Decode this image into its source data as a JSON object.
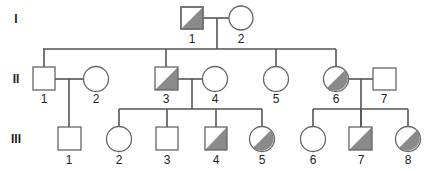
{
  "colors": {
    "affected_fill": "#8a8a8a",
    "line": "#555555",
    "outline": "#666666"
  },
  "generations": [
    {
      "label": "I",
      "y": 19
    },
    {
      "label": "II",
      "y": 79
    },
    {
      "label": "III",
      "y": 139
    }
  ],
  "individuals": {
    "I-1": {
      "label": "1",
      "sex": "male",
      "affected": "half"
    },
    "I-2": {
      "label": "2",
      "sex": "female",
      "affected": "none"
    },
    "II-1": {
      "label": "1",
      "sex": "male",
      "affected": "none"
    },
    "II-2": {
      "label": "2",
      "sex": "female",
      "affected": "none"
    },
    "II-3": {
      "label": "3",
      "sex": "male",
      "affected": "half"
    },
    "II-4": {
      "label": "4",
      "sex": "female",
      "affected": "none"
    },
    "II-5": {
      "label": "5",
      "sex": "female",
      "affected": "none"
    },
    "II-6": {
      "label": "6",
      "sex": "female",
      "affected": "half"
    },
    "II-7": {
      "label": "7",
      "sex": "male",
      "affected": "none"
    },
    "III-1": {
      "label": "1",
      "sex": "male",
      "affected": "none"
    },
    "III-2": {
      "label": "2",
      "sex": "female",
      "affected": "none"
    },
    "III-3": {
      "label": "3",
      "sex": "male",
      "affected": "none"
    },
    "III-4": {
      "label": "4",
      "sex": "male",
      "affected": "half"
    },
    "III-5": {
      "label": "5",
      "sex": "female",
      "affected": "half"
    },
    "III-6": {
      "label": "6",
      "sex": "female",
      "affected": "none"
    },
    "III-7": {
      "label": "7",
      "sex": "male",
      "affected": "half"
    },
    "III-8": {
      "label": "8",
      "sex": "female",
      "affected": "half"
    }
  },
  "gen_labels": {
    "g1": "I",
    "g2": "II",
    "g3": "III"
  },
  "labels": {
    "I1": "1",
    "I2": "2",
    "II1": "1",
    "II2": "2",
    "II3": "3",
    "II4": "4",
    "II5": "5",
    "II6": "6",
    "II7": "7",
    "III1": "1",
    "III2": "2",
    "III3": "3",
    "III4": "4",
    "III5": "5",
    "III6": "6",
    "III7": "7",
    "III8": "8"
  }
}
